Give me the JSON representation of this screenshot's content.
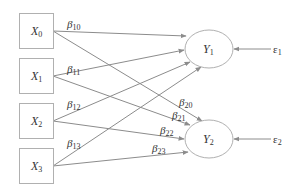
{
  "diagram": {
    "inputs": [
      {
        "id": "X0",
        "label": "X",
        "sub": "0"
      },
      {
        "id": "X1",
        "label": "X",
        "sub": "1"
      },
      {
        "id": "X2",
        "label": "X",
        "sub": "2"
      },
      {
        "id": "X3",
        "label": "X",
        "sub": "3"
      }
    ],
    "outputs": [
      {
        "id": "Y1",
        "label": "Y",
        "sub": "1"
      },
      {
        "id": "Y2",
        "label": "Y",
        "sub": "2"
      }
    ],
    "errors": [
      {
        "id": "e1",
        "label": "ε",
        "sub": "1",
        "target": "Y1"
      },
      {
        "id": "e2",
        "label": "ε",
        "sub": "2",
        "target": "Y2"
      }
    ],
    "coefficients": [
      {
        "label": "β",
        "sub": "10",
        "from": "X0",
        "to": "Y1"
      },
      {
        "label": "β",
        "sub": "11",
        "from": "X1",
        "to": "Y1"
      },
      {
        "label": "β",
        "sub": "12",
        "from": "X2",
        "to": "Y1"
      },
      {
        "label": "β",
        "sub": "13",
        "from": "X3",
        "to": "Y1"
      },
      {
        "label": "β",
        "sub": "20",
        "from": "X0",
        "to": "Y2"
      },
      {
        "label": "β",
        "sub": "21",
        "from": "X1",
        "to": "Y2"
      },
      {
        "label": "β",
        "sub": "22",
        "from": "X2",
        "to": "Y2"
      },
      {
        "label": "β",
        "sub": "23",
        "from": "X3",
        "to": "Y2"
      }
    ]
  }
}
